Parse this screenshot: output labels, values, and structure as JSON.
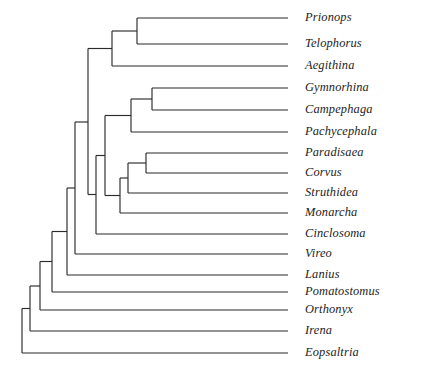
{
  "figure": {
    "type": "cladogram",
    "title": "",
    "width": 426,
    "height": 378,
    "background_color": "#ffffff",
    "line_color": "#2b2b2b",
    "text_color": "#1d1d1d"
  },
  "chart_data": {
    "type": "tree",
    "title": "",
    "xlabel": "",
    "ylabel": "",
    "grid": false,
    "legend": "none",
    "taxa": [
      "Prionops",
      "Telophorus",
      "Aegithina",
      "Gymnorhina",
      "Campephaga",
      "Pachycephala",
      "Paradisaea",
      "Corvus",
      "Struthidea",
      "Monarcha",
      "Cinclosoma",
      "Vireo",
      "Lanius",
      "Pomatostomus",
      "Orthonyx",
      "Irena",
      "Eopsaltria"
    ],
    "leaf_count": 17,
    "leaves": [
      {
        "name": "Prionops",
        "y": 18,
        "tip_x": 288,
        "label_x": 305
      },
      {
        "name": "Telophorus",
        "y": 44,
        "tip_x": 288,
        "label_x": 305
      },
      {
        "name": "Aegithina",
        "y": 66,
        "tip_x": 288,
        "label_x": 305
      },
      {
        "name": "Gymnorhina",
        "y": 88,
        "tip_x": 288,
        "label_x": 305
      },
      {
        "name": "Campephaga",
        "y": 110,
        "tip_x": 288,
        "label_x": 305
      },
      {
        "name": "Pachycephala",
        "y": 132,
        "tip_x": 288,
        "label_x": 305
      },
      {
        "name": "Paradisaea",
        "y": 153,
        "tip_x": 288,
        "label_x": 305
      },
      {
        "name": "Corvus",
        "y": 173,
        "tip_x": 288,
        "label_x": 305
      },
      {
        "name": "Struthidea",
        "y": 193,
        "tip_x": 288,
        "label_x": 305
      },
      {
        "name": "Monarcha",
        "y": 213,
        "tip_x": 288,
        "label_x": 305
      },
      {
        "name": "Cinclosoma",
        "y": 234,
        "tip_x": 288,
        "label_x": 305
      },
      {
        "name": "Vireo",
        "y": 254,
        "tip_x": 288,
        "label_x": 305
      },
      {
        "name": "Lanius",
        "y": 275,
        "tip_x": 288,
        "label_x": 305
      },
      {
        "name": "Pomatostomus",
        "y": 292,
        "tip_x": 288,
        "label_x": 305
      },
      {
        "name": "Orthonyx",
        "y": 310,
        "tip_x": 288,
        "label_x": 305
      },
      {
        "name": "Irena",
        "y": 331,
        "tip_x": 288,
        "label_x": 305
      },
      {
        "name": "Eopsaltria",
        "y": 353,
        "tip_x": 288,
        "label_x": 305
      }
    ],
    "nodes": [
      {
        "id": "n_prio_telo",
        "x": 137,
        "y_top": 18,
        "y_bottom": 44,
        "children": [
          "Prionops",
          "Telophorus"
        ]
      },
      {
        "id": "n_shrike",
        "x": 112,
        "y_top": 31,
        "y_bottom": 66,
        "children": [
          "n_prio_telo",
          "Aegithina"
        ]
      },
      {
        "id": "n_gym_camp",
        "x": 152,
        "y_top": 88,
        "y_bottom": 110,
        "children": [
          "Gymnorhina",
          "Campephaga"
        ]
      },
      {
        "id": "n_pachy",
        "x": 131,
        "y_top": 99,
        "y_bottom": 132,
        "children": [
          "n_gym_camp",
          "Pachycephala"
        ]
      },
      {
        "id": "n_para_corv",
        "x": 146,
        "y_top": 153,
        "y_bottom": 173,
        "children": [
          "Paradisaea",
          "Corvus"
        ]
      },
      {
        "id": "n_struth",
        "x": 128,
        "y_top": 163,
        "y_bottom": 193,
        "children": [
          "n_para_corv",
          "Struthidea"
        ]
      },
      {
        "id": "n_monarch",
        "x": 120,
        "y_top": 178,
        "y_bottom": 213,
        "children": [
          "n_struth",
          "Monarcha"
        ]
      },
      {
        "id": "n_corvida",
        "x": 105,
        "y_top": 115,
        "y_bottom": 196,
        "children": [
          "n_pachy",
          "n_monarch"
        ]
      },
      {
        "id": "n_cinclo",
        "x": 96,
        "y_top": 155,
        "y_bottom": 234,
        "children": [
          "n_corvida",
          "Cinclosoma"
        ]
      },
      {
        "id": "n_upper",
        "x": 88,
        "y_top": 49,
        "y_bottom": 195,
        "children": [
          "n_shrike",
          "n_cinclo"
        ]
      },
      {
        "id": "n_vireo",
        "x": 75,
        "y_top": 122,
        "y_bottom": 254,
        "children": [
          "n_upper",
          "Vireo"
        ]
      },
      {
        "id": "n_lanius",
        "x": 67,
        "y_top": 188,
        "y_bottom": 275,
        "children": [
          "n_vireo",
          "Lanius"
        ]
      },
      {
        "id": "n_pomato",
        "x": 52,
        "y_top": 231,
        "y_bottom": 292,
        "children": [
          "n_lanius",
          "Pomatostomus"
        ]
      },
      {
        "id": "n_orthonyx",
        "x": 40,
        "y_top": 262,
        "y_bottom": 310,
        "children": [
          "n_pomato",
          "Orthonyx"
        ]
      },
      {
        "id": "n_irena",
        "x": 30,
        "y_top": 286,
        "y_bottom": 331,
        "children": [
          "n_orthonyx",
          "Irena"
        ]
      },
      {
        "id": "n_root",
        "x": 22,
        "y_top": 308,
        "y_bottom": 353,
        "children": [
          "n_irena",
          "Eopsaltria"
        ]
      }
    ]
  }
}
